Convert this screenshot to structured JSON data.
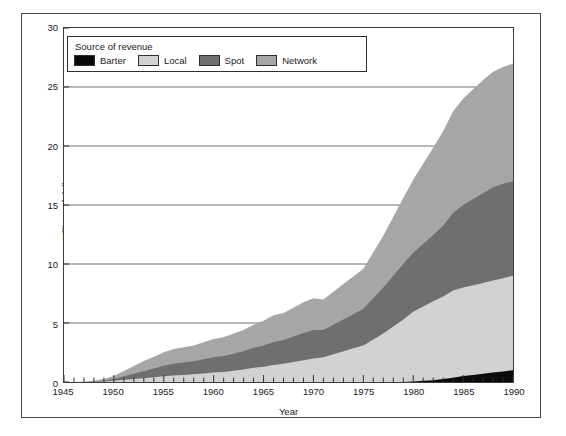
{
  "figure": {
    "ylabel": "Billions of dollars",
    "xlabel": "Year"
  },
  "legend": {
    "title": "Source of revenue",
    "items": [
      {
        "label": "Barter",
        "color": "#0a0a0a"
      },
      {
        "label": "Local",
        "color": "#d2d2d2"
      },
      {
        "label": "Spot",
        "color": "#6f6f6f"
      },
      {
        "label": "Network",
        "color": "#a6a6a6"
      }
    ]
  },
  "axes": {
    "y_ticks": [
      "0",
      "5",
      "10",
      "15",
      "20",
      "25",
      "30"
    ],
    "x_ticks": [
      "1945",
      "1950",
      "1955",
      "1960",
      "1965",
      "1970",
      "1975",
      "1980",
      "1985",
      "1990"
    ]
  },
  "chart_data": {
    "type": "area",
    "title": "",
    "xlabel": "Year",
    "ylabel": "Billions of dollars",
    "xlim": [
      1945,
      1990
    ],
    "ylim": [
      0,
      30
    ],
    "grid": true,
    "gridlines_y": [
      5,
      10,
      15,
      20,
      25
    ],
    "legend_position": "top-left-inside",
    "stacked": true,
    "stack_order_bottom_to_top": [
      "Barter",
      "Local",
      "Spot",
      "Network"
    ],
    "x": [
      1945,
      1946,
      1947,
      1948,
      1949,
      1950,
      1951,
      1952,
      1953,
      1954,
      1955,
      1956,
      1957,
      1958,
      1959,
      1960,
      1961,
      1962,
      1963,
      1964,
      1965,
      1966,
      1967,
      1968,
      1969,
      1970,
      1971,
      1972,
      1973,
      1974,
      1975,
      1976,
      1977,
      1978,
      1979,
      1980,
      1981,
      1982,
      1983,
      1984,
      1985,
      1986,
      1987,
      1988,
      1989,
      1990
    ],
    "series": [
      {
        "name": "Barter",
        "color": "#0a0a0a",
        "values": [
          0,
          0,
          0,
          0,
          0,
          0,
          0,
          0,
          0,
          0,
          0,
          0,
          0,
          0,
          0,
          0,
          0,
          0,
          0,
          0,
          0,
          0,
          0,
          0,
          0,
          0,
          0,
          0,
          0,
          0,
          0,
          0,
          0,
          0,
          0,
          0.05,
          0.1,
          0.15,
          0.25,
          0.35,
          0.5,
          0.6,
          0.7,
          0.8,
          0.9,
          1.0
        ]
      },
      {
        "name": "Local",
        "color": "#d2d2d2",
        "values": [
          0,
          0,
          0,
          0.02,
          0.05,
          0.1,
          0.18,
          0.25,
          0.32,
          0.4,
          0.48,
          0.55,
          0.6,
          0.65,
          0.72,
          0.8,
          0.85,
          0.95,
          1.05,
          1.2,
          1.3,
          1.45,
          1.55,
          1.7,
          1.85,
          2.0,
          2.1,
          2.35,
          2.6,
          2.85,
          3.1,
          3.6,
          4.1,
          4.7,
          5.3,
          5.9,
          6.3,
          6.7,
          7.0,
          7.4,
          7.5,
          7.6,
          7.7,
          7.8,
          7.9,
          8.0
        ]
      },
      {
        "name": "Spot",
        "color": "#6f6f6f",
        "values": [
          0,
          0,
          0,
          0.03,
          0.08,
          0.15,
          0.3,
          0.45,
          0.6,
          0.75,
          0.9,
          1.0,
          1.05,
          1.1,
          1.2,
          1.3,
          1.35,
          1.45,
          1.55,
          1.7,
          1.8,
          1.95,
          2.0,
          2.15,
          2.3,
          2.4,
          2.3,
          2.5,
          2.7,
          2.9,
          3.1,
          3.5,
          3.9,
          4.3,
          4.7,
          5.0,
          5.3,
          5.6,
          6.0,
          6.6,
          7.0,
          7.3,
          7.6,
          7.9,
          8.0,
          8.0
        ]
      },
      {
        "name": "Network",
        "color": "#a6a6a6",
        "values": [
          0,
          0,
          0.02,
          0.05,
          0.12,
          0.25,
          0.45,
          0.65,
          0.85,
          1.0,
          1.15,
          1.25,
          1.3,
          1.35,
          1.45,
          1.55,
          1.6,
          1.7,
          1.8,
          1.95,
          2.1,
          2.25,
          2.3,
          2.45,
          2.6,
          2.7,
          2.6,
          2.8,
          3.0,
          3.2,
          3.4,
          3.9,
          4.4,
          5.0,
          5.6,
          6.2,
          6.8,
          7.4,
          8.0,
          8.6,
          9.0,
          9.3,
          9.6,
          9.8,
          9.9,
          10.0
        ]
      }
    ],
    "totals_note": "stacked total reaches about 27 billion dollars in 1990"
  }
}
